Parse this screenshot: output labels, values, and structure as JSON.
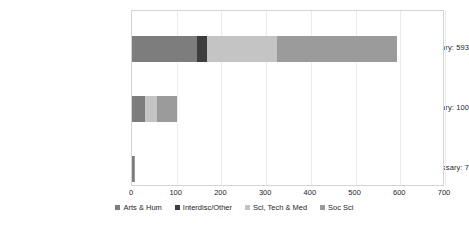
{
  "chart_data": {
    "type": "bar",
    "orientation": "horizontal",
    "stacked": true,
    "title": "",
    "xlabel": "",
    "ylabel": "",
    "xlim": [
      0,
      700
    ],
    "xticks": [
      0,
      100,
      200,
      300,
      400,
      500,
      600,
      700
    ],
    "xtick_labels": [
      "0",
      "100",
      "200",
      "300",
      "400",
      "500",
      "600",
      "700"
    ],
    "grid": true,
    "grid_axis": "x",
    "legend_position": "bottom",
    "categories": [
      "Very necessary: 593",
      "Somewhat necessary: 100",
      "Not necessary: 7"
    ],
    "category_totals": [
      593,
      100,
      7
    ],
    "series": [
      {
        "name": "Arts & Hum",
        "color": "#7d7d7d",
        "values": [
          145,
          30,
          4
        ]
      },
      {
        "name": "Interdisc/Other",
        "color": "#3d3d3d",
        "values": [
          23,
          0,
          0
        ]
      },
      {
        "name": "Sci, Tech & Med",
        "color": "#c4c4c4",
        "values": [
          157,
          25,
          0
        ]
      },
      {
        "name": "Soc Sci",
        "color": "#9b9b9b",
        "values": [
          268,
          45,
          3
        ]
      }
    ]
  },
  "axis": {
    "plot_border_color": "#d4d4d4",
    "gridline_color": "#ececec",
    "tick_text_color": "#262626"
  }
}
